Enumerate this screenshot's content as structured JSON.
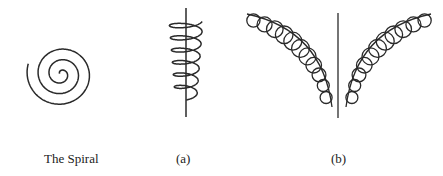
{
  "figures": [
    {
      "id": "spiral",
      "caption": "The Spiral"
    },
    {
      "id": "a",
      "caption": "(a)"
    },
    {
      "id": "b",
      "caption": "(b)"
    }
  ],
  "colors": {
    "stroke": "#2a2a2a",
    "background": "#ffffff"
  }
}
